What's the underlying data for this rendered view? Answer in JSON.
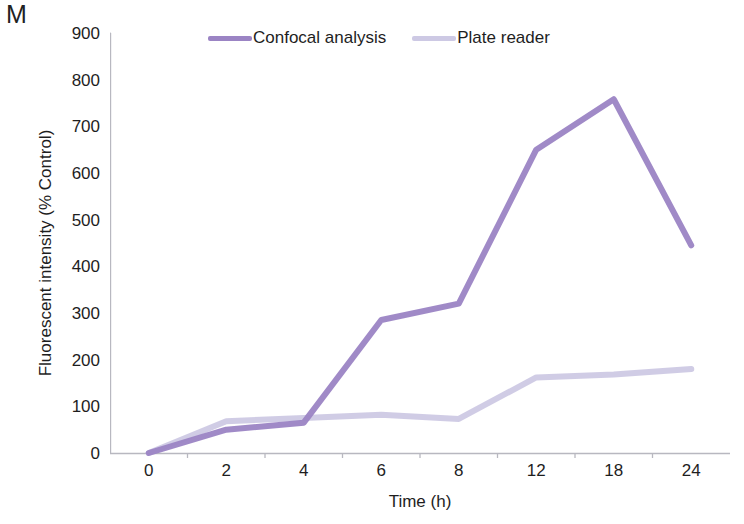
{
  "panel": {
    "label": "M"
  },
  "legend": {
    "position": "top-center",
    "entries": [
      {
        "name": "Confocal analysis",
        "color": "#9b84c4"
      },
      {
        "name": "Plate reader",
        "color": "#cdc9e4"
      }
    ]
  },
  "axes": {
    "x": {
      "title": "Time (h)",
      "ticks": [
        "0",
        "2",
        "4",
        "6",
        "8",
        "12",
        "18",
        "24"
      ]
    },
    "y": {
      "title": "Fluorescent intensity (% Control)",
      "ticks": [
        "0",
        "100",
        "200",
        "300",
        "400",
        "500",
        "600",
        "700",
        "800",
        "900"
      ],
      "min": 0,
      "max": 900,
      "step": 100
    }
  },
  "chart_data": {
    "type": "line",
    "title": "M",
    "xlabel": "Time (h)",
    "ylabel": "Fluorescent intensity (% Control)",
    "categories": [
      "0",
      "2",
      "4",
      "6",
      "8",
      "12",
      "18",
      "24"
    ],
    "ylim": [
      0,
      900
    ],
    "ytick_step": 100,
    "grid": false,
    "legend_position": "top-center",
    "series": [
      {
        "name": "Confocal analysis",
        "color": "#9b84c4",
        "line_width": 6,
        "values": [
          0,
          50,
          65,
          285,
          320,
          650,
          758,
          445
        ]
      },
      {
        "name": "Plate reader",
        "color": "#cdc9e4",
        "line_width": 6,
        "values": [
          0,
          68,
          75,
          82,
          73,
          162,
          168,
          180
        ]
      }
    ]
  }
}
